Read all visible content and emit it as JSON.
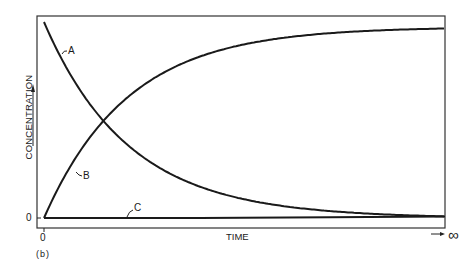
{
  "chart_data": {
    "type": "line",
    "title": "",
    "panel_label": "(b)",
    "xlabel": "TIME",
    "ylabel": "CONCENTRATION",
    "x_ticks": [
      "0"
    ],
    "x_end_label": "→ ∞",
    "y_ticks": [
      "0"
    ],
    "grid": false,
    "legend": "inline curve labels",
    "x": [
      0,
      0.1,
      0.2,
      0.3,
      0.4,
      0.5,
      0.6,
      0.7,
      0.8,
      0.9,
      1.0
    ],
    "series": [
      {
        "name": "A",
        "values": [
          1.0,
          0.5,
          0.25,
          0.12,
          0.06,
          0.03,
          0.02,
          0.01,
          0.01,
          0.0,
          0.0
        ]
      },
      {
        "name": "B",
        "values": [
          0.0,
          0.5,
          0.75,
          0.87,
          0.93,
          0.96,
          0.97,
          0.98,
          0.98,
          0.99,
          0.99
        ]
      },
      {
        "name": "C",
        "values": [
          0.0,
          0.0,
          0.0,
          0.0,
          0.0,
          0.005,
          0.005,
          0.01,
          0.01,
          0.01,
          0.01
        ]
      }
    ],
    "curve_labels": {
      "A": "A",
      "B": "B",
      "C": "C"
    }
  }
}
